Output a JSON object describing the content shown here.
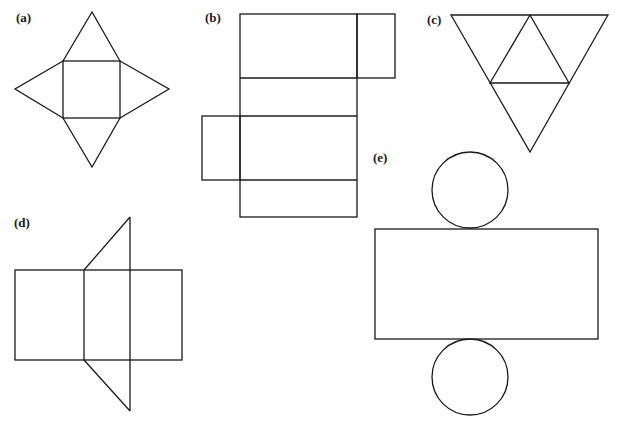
{
  "stroke_color": "#1a1a1a",
  "background": "#ffffff",
  "figures": [
    {
      "label": "(a)",
      "shape": "square-based pyramid net",
      "description": "square with four triangles on each side"
    },
    {
      "label": "(b)",
      "shape": "rectangular prism net",
      "description": "four stacked rectangles with two square side flaps"
    },
    {
      "label": "(c)",
      "shape": "triangular pyramid (tetrahedron) net",
      "description": "large inverted triangle subdivided into four triangles"
    },
    {
      "label": "(d)",
      "shape": "triangular prism net",
      "description": "three rectangles with two triangles"
    },
    {
      "label": "(e)",
      "shape": "cylinder net",
      "description": "rectangle with circles above and below"
    }
  ]
}
